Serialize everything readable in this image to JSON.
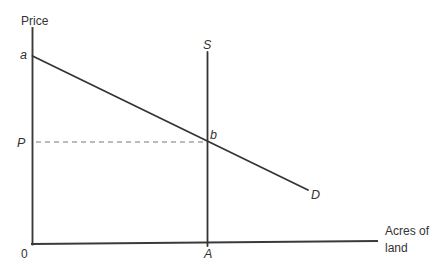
{
  "diagram": {
    "type": "supply-demand-land-market-graph",
    "background_color": "#ffffff",
    "line_color": "#3a3a3a",
    "dashed_line_color": "#787878",
    "text_color": "#333333",
    "y_axis_label": "Price",
    "x_axis_label_line1": "Acres of",
    "x_axis_label_line2": "land",
    "origin_label": "0",
    "supply_curve_label": "S",
    "demand_curve_label": "D",
    "demand_intercept_label": "a",
    "equilibrium_point_label": "b",
    "equilibrium_price_label": "P",
    "equilibrium_quantity_label": "A"
  }
}
